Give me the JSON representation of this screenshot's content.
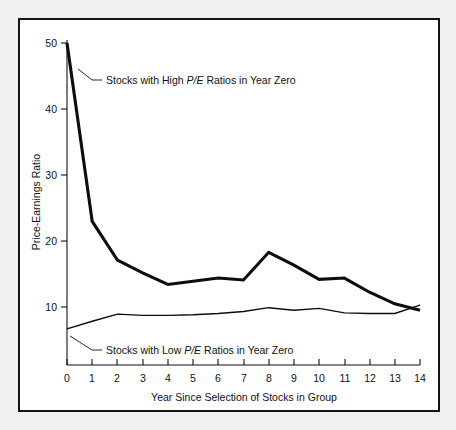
{
  "chart_data": {
    "type": "line",
    "title": "",
    "xlabel": "Year Since Selection of Stocks in Group",
    "ylabel": "Price-Earnings Ratio",
    "x": [
      0,
      1,
      2,
      3,
      4,
      5,
      6,
      7,
      8,
      9,
      10,
      11,
      12,
      13,
      14
    ],
    "xlim": [
      0,
      14
    ],
    "ylim": [
      0,
      50
    ],
    "x_ticks": [
      "0",
      "1",
      "2",
      "3",
      "4",
      "5",
      "6",
      "7",
      "8",
      "9",
      "10",
      "11",
      "12",
      "13",
      "14"
    ],
    "y_ticks": [
      "10",
      "20",
      "30",
      "40",
      "50"
    ],
    "y_tick_values": [
      10,
      20,
      30,
      40,
      50
    ],
    "grid": false,
    "legend_position": "inline-annotations",
    "series": [
      {
        "name": "Stocks with High P/E Ratios in Year Zero",
        "name_prefix": "Stocks with High ",
        "name_emphasis": "P/E",
        "name_suffix": " Ratios in Year Zero",
        "style": "thick",
        "values": [
          50.0,
          22.3,
          16.3,
          14.3,
          12.5,
          13.0,
          13.5,
          13.2,
          17.5,
          15.5,
          13.3,
          13.5,
          11.3,
          9.5,
          8.5
        ]
      },
      {
        "name": "Stocks with Low P/E Ratios in Year Zero",
        "name_prefix": "Stocks with Low ",
        "name_emphasis": "P/E",
        "name_suffix": " Ratios in Year Zero",
        "style": "thin",
        "values": [
          5.6,
          6.8,
          7.9,
          7.7,
          7.7,
          7.8,
          8.0,
          8.3,
          8.9,
          8.5,
          8.8,
          8.1,
          8.0,
          8.0,
          9.3
        ]
      }
    ],
    "annotations": [
      {
        "id": "high-pe-annotation",
        "text": "Stocks with High P/E Ratios in Year Zero",
        "prefix": "Stocks with High ",
        "emphasis": "P/E",
        "suffix": " Ratios in Year Zero"
      },
      {
        "id": "low-pe-annotation",
        "text": "Stocks with Low P/E Ratios in Year Zero",
        "prefix": "Stocks with Low ",
        "emphasis": "P/E",
        "suffix": " Ratios in Year Zero"
      }
    ]
  },
  "colors": {
    "frame": "#141414",
    "ink": "#111111",
    "series": "#0d0d0d",
    "plot_background": "#ffffff",
    "page_background": "#f0f0f0"
  }
}
